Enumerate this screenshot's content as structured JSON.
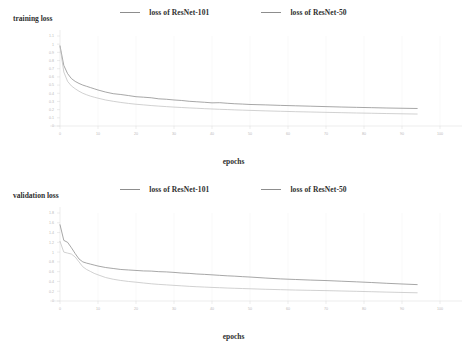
{
  "chart_data": [
    {
      "type": "line",
      "title": "training loss",
      "xlabel": "epochs",
      "ylabel": "training loss",
      "xlim": [
        0,
        100
      ],
      "ylim": [
        0,
        1.1
      ],
      "grid": true,
      "legend_position": "top-center",
      "xticks": [
        "0",
        "10",
        "20",
        "30",
        "40",
        "50",
        "60",
        "70",
        "80",
        "90",
        "100"
      ],
      "yticks": [
        "1.1",
        "1",
        "0.9",
        "0.8",
        "0.7",
        "0.6",
        "0.5",
        "0.4",
        "0.3",
        "0.2",
        "0.1",
        "0"
      ],
      "x": [
        0,
        1,
        2,
        3,
        4,
        5,
        6,
        7,
        8,
        9,
        10,
        12,
        14,
        16,
        18,
        20,
        22,
        24,
        26,
        28,
        30,
        32,
        34,
        36,
        38,
        40,
        42,
        44,
        46,
        48,
        50,
        54,
        58,
        62,
        66,
        70,
        74,
        78,
        82,
        86,
        90,
        94
      ],
      "series": [
        {
          "name": "loss of ResNet-101",
          "color": "#8a8a8a",
          "values": [
            0.98,
            0.74,
            0.64,
            0.58,
            0.545,
            0.52,
            0.5,
            0.485,
            0.47,
            0.455,
            0.44,
            0.415,
            0.395,
            0.385,
            0.372,
            0.358,
            0.352,
            0.345,
            0.332,
            0.327,
            0.318,
            0.312,
            0.302,
            0.296,
            0.29,
            0.283,
            0.285,
            0.278,
            0.272,
            0.268,
            0.263,
            0.258,
            0.252,
            0.247,
            0.242,
            0.237,
            0.232,
            0.228,
            0.224,
            0.22,
            0.217,
            0.214
          ]
        },
        {
          "name": "loss of ResNet-50",
          "color": "#c2c2c2",
          "values": [
            0.97,
            0.66,
            0.545,
            0.49,
            0.455,
            0.425,
            0.4,
            0.382,
            0.365,
            0.352,
            0.34,
            0.318,
            0.302,
            0.288,
            0.276,
            0.266,
            0.258,
            0.25,
            0.243,
            0.237,
            0.231,
            0.226,
            0.221,
            0.217,
            0.212,
            0.208,
            0.204,
            0.201,
            0.197,
            0.194,
            0.191,
            0.185,
            0.18,
            0.175,
            0.171,
            0.167,
            0.163,
            0.159,
            0.156,
            0.152,
            0.149,
            0.146
          ]
        }
      ]
    },
    {
      "type": "line",
      "title": "validation loss",
      "xlabel": "epochs",
      "ylabel": "validation loss",
      "xlim": [
        0,
        100
      ],
      "ylim": [
        0,
        1.8
      ],
      "grid": true,
      "legend_position": "top-center",
      "xticks": [
        "0",
        "10",
        "20",
        "30",
        "40",
        "50",
        "60",
        "70",
        "80",
        "90",
        "100"
      ],
      "yticks": [
        "1.8",
        "1.6",
        "1.4",
        "1.2",
        "1",
        "0.8",
        "0.6",
        "0.4",
        "0.2",
        "0"
      ],
      "x": [
        0,
        1,
        2,
        3,
        4,
        5,
        6,
        7,
        8,
        9,
        10,
        12,
        14,
        16,
        18,
        20,
        22,
        24,
        26,
        28,
        30,
        32,
        34,
        36,
        38,
        40,
        42,
        44,
        46,
        48,
        50,
        54,
        58,
        62,
        66,
        70,
        74,
        78,
        82,
        86,
        90,
        94
      ],
      "series": [
        {
          "name": "loss of ResNet-101",
          "color": "#8a8a8a",
          "values": [
            1.56,
            1.24,
            1.2,
            1.09,
            0.97,
            0.86,
            0.8,
            0.775,
            0.755,
            0.735,
            0.715,
            0.685,
            0.665,
            0.645,
            0.635,
            0.625,
            0.615,
            0.612,
            0.6,
            0.595,
            0.585,
            0.572,
            0.565,
            0.552,
            0.545,
            0.535,
            0.525,
            0.515,
            0.508,
            0.498,
            0.49,
            0.47,
            0.452,
            0.44,
            0.428,
            0.418,
            0.405,
            0.392,
            0.378,
            0.362,
            0.348,
            0.335
          ]
        },
        {
          "name": "loss of ResNet-50",
          "color": "#c2c2c2",
          "values": [
            1.22,
            1.0,
            0.98,
            0.96,
            0.9,
            0.8,
            0.7,
            0.645,
            0.605,
            0.565,
            0.535,
            0.48,
            0.445,
            0.42,
            0.4,
            0.385,
            0.368,
            0.352,
            0.34,
            0.33,
            0.32,
            0.31,
            0.3,
            0.292,
            0.285,
            0.278,
            0.272,
            0.265,
            0.26,
            0.255,
            0.25,
            0.24,
            0.232,
            0.224,
            0.218,
            0.212,
            0.205,
            0.198,
            0.19,
            0.182,
            0.175,
            0.168
          ]
        }
      ]
    }
  ]
}
